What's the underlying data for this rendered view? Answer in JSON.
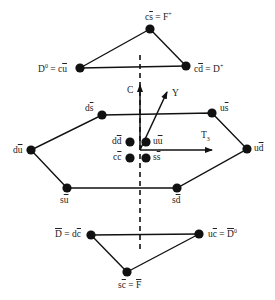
{
  "colors": {
    "ink": "#111111",
    "background": "#ffffff"
  },
  "axes": {
    "C": {
      "label": "C"
    },
    "Y": {
      "label": "Y"
    },
    "T3": {
      "label": "T",
      "sub": "3"
    }
  },
  "top_triangle": {
    "nodes": [
      {
        "id": "Fplus",
        "q": "c",
        "qbar": "s",
        "eq": " = F",
        "sup": "+"
      },
      {
        "id": "D0",
        "pre": "D",
        "pre_sup": "0",
        "eq": " = ",
        "q": "c",
        "qbar": "u"
      },
      {
        "id": "Dplus",
        "q": "c",
        "qbar": "d",
        "eq": " = D",
        "sup": "+"
      }
    ]
  },
  "middle_hexagon": {
    "nodes": [
      {
        "id": "ds",
        "q": "d",
        "qbar": "s"
      },
      {
        "id": "us",
        "q": "u",
        "qbar": "s"
      },
      {
        "id": "du",
        "q": "d",
        "qbar": "u"
      },
      {
        "id": "ud",
        "q": "u",
        "qbar": "d"
      },
      {
        "id": "su",
        "q": "s",
        "qbar": "u"
      },
      {
        "id": "sd",
        "q": "s",
        "qbar": "d"
      }
    ],
    "center": [
      {
        "id": "dd",
        "q": "d",
        "qbar": "d"
      },
      {
        "id": "uu",
        "q": "u",
        "qbar": "u"
      },
      {
        "id": "cc",
        "q": "c",
        "qbar": "c"
      },
      {
        "id": "ss",
        "q": "s",
        "qbar": "s"
      }
    ]
  },
  "bottom_triangle": {
    "nodes": [
      {
        "id": "Dbar",
        "pre": "D",
        "eq": " = ",
        "q": "d",
        "qbar": "c"
      },
      {
        "id": "D0bar",
        "q": "u",
        "qbar": "c",
        "eq": " = ",
        "post": "D",
        "post_sup": "0"
      },
      {
        "id": "Fbar",
        "q": "s",
        "qbar": "c",
        "eq": " = ",
        "post": "F"
      }
    ]
  }
}
